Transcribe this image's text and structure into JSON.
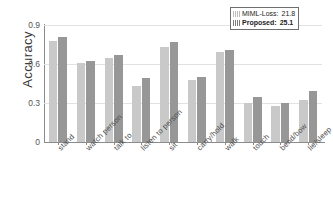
{
  "chart_data": {
    "type": "bar",
    "title": "",
    "xlabel": "",
    "ylabel": "Accuracy",
    "ylim": [
      0,
      0.9
    ],
    "yticks": [
      "0",
      "0.3",
      "0.6",
      "0.9"
    ],
    "ytick_values": [
      0,
      0.3,
      0.6,
      0.9
    ],
    "grid": true,
    "legend_position": "top-right",
    "categories": [
      "stand",
      "watch person",
      "talk to",
      "listen to person",
      "sit",
      "carry/hold",
      "walk",
      "touch",
      "bend/bow",
      "lie/sleep"
    ],
    "series": [
      {
        "name": "MIML-Loss",
        "mean": "21.8",
        "color": "#c9c9c9",
        "values": [
          0.78,
          0.61,
          0.65,
          0.43,
          0.73,
          0.48,
          0.69,
          0.3,
          0.28,
          0.32
        ]
      },
      {
        "name": "Proposed",
        "mean": "25.1",
        "color": "#979797",
        "values": [
          0.81,
          0.62,
          0.67,
          0.49,
          0.77,
          0.5,
          0.71,
          0.35,
          0.3,
          0.39
        ]
      }
    ]
  },
  "legend": {
    "rows": [
      {
        "label": "MIML-Loss:",
        "value": "21.8"
      },
      {
        "label": "Proposed:",
        "value": "25.1"
      }
    ]
  },
  "axes": {
    "y_label": "Accuracy"
  }
}
